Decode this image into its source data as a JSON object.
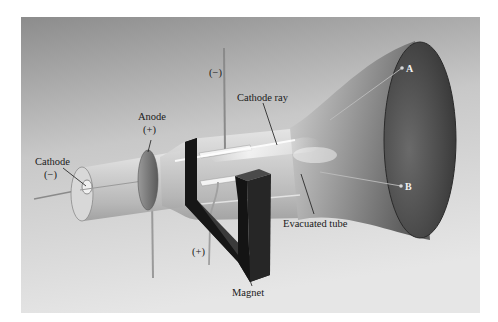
{
  "figure": {
    "colors": {
      "background_top": "#8e8e8e",
      "background_bottom": "#e4e4e4",
      "screen": "#4a4a4a",
      "magnet": "#1e1e1e",
      "glass": "#c9c9c9",
      "label_text": "#1a1a1a",
      "point_label_text": "#f2f2f2"
    }
  },
  "labels": {
    "cathode": "Cathode",
    "cathode_sign": "(−)",
    "anode": "Anode",
    "anode_sign": "(+)",
    "top_plate_sign": "(−)",
    "bottom_plate_sign": "(+)",
    "cathode_ray": "Cathode ray",
    "evacuated_tube": "Evacuated tube",
    "magnet": "Magnet",
    "point_a": "A",
    "point_b": "B"
  }
}
